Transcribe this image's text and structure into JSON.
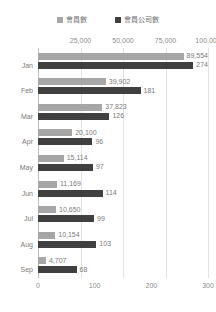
{
  "chart_data": {
    "type": "bar",
    "orientation": "horizontal",
    "title": "",
    "xlabel": "",
    "ylabel": "",
    "grid": true,
    "legend_position": "top",
    "categories": [
      "Jan",
      "Feb",
      "Mar",
      "Apr",
      "May",
      "Jun",
      "Jul",
      "Aug",
      "Sep"
    ],
    "series": [
      {
        "name": "會員數",
        "color": "#a6a6a6",
        "axis": "top",
        "axis_range": [
          0,
          100000
        ],
        "axis_ticks": [
          0,
          25000,
          50000,
          75000,
          100000
        ],
        "values": [
          89554,
          39902,
          37823,
          20100,
          15114,
          11169,
          10650,
          10154,
          4707
        ],
        "value_labels": [
          "89,554",
          "39,902",
          "37,823",
          "20,100",
          "15,114",
          "11,169",
          "10,650",
          "10,154",
          "4,707"
        ]
      },
      {
        "name": "會員公司數",
        "color": "#404040",
        "axis": "bottom",
        "axis_range": [
          0,
          300
        ],
        "axis_ticks": [
          0,
          100,
          200,
          300
        ],
        "values": [
          274,
          181,
          126,
          96,
          97,
          114,
          99,
          103,
          68
        ],
        "value_labels": [
          "274",
          "181",
          "126",
          "96",
          "97",
          "114",
          "99",
          "103",
          "68"
        ]
      }
    ]
  },
  "legend": {
    "items": [
      {
        "label": "會員數",
        "color": "#a6a6a6",
        "swatch_name": "legend-swatch-members"
      },
      {
        "label": "會員公司數",
        "color": "#404040",
        "swatch_name": "legend-swatch-member-companies"
      }
    ]
  },
  "axes": {
    "top": {
      "tick_labels": [
        "25,000",
        "50,000",
        "75,000",
        "100,000"
      ]
    },
    "bottom": {
      "tick_labels": [
        "0",
        "100",
        "200",
        "300"
      ]
    }
  },
  "colors": {
    "series_light": "#a6a6a6",
    "series_dark": "#404040",
    "gridline": "#e2e2e2",
    "axis_line": "#bdbdbd",
    "tick_text": "#8c8c8c",
    "value_text": "#7a7a7a",
    "legend_text": "#6b6b6b",
    "background": "#ffffff"
  }
}
